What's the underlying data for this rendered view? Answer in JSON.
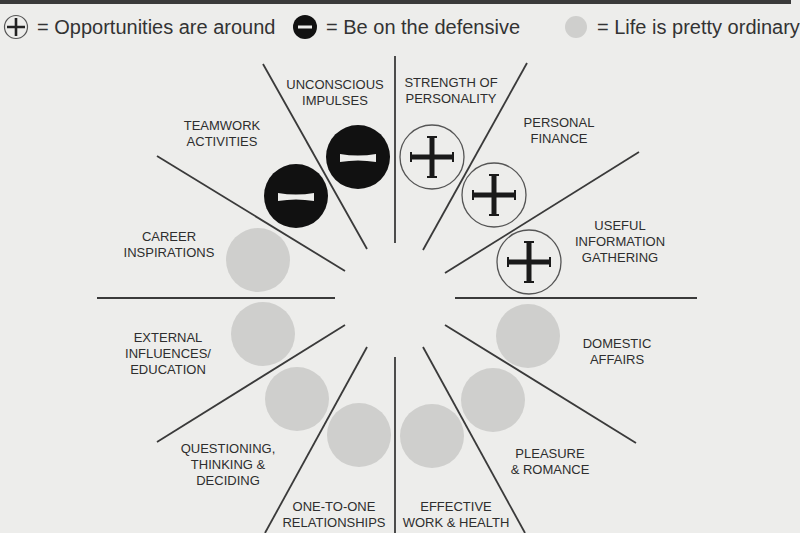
{
  "legend": {
    "items": [
      {
        "symbol": "plus-circle-icon",
        "label": "= Opportunities are around"
      },
      {
        "symbol": "minus-circle-icon",
        "label": "= Be on the defensive"
      },
      {
        "symbol": "grey-dot-icon",
        "label": "= Life is pretty ordinary"
      }
    ]
  },
  "colors": {
    "background": "#ededeb",
    "line": "#3a3a3a",
    "plus_ring": "#555555",
    "minus_fill": "#111111",
    "ordinary_fill": "#cfcfcd"
  },
  "segments": [
    {
      "line1": "STRENGTH OF",
      "line2": "PERSONALITY",
      "line3": "",
      "status": "opportunity"
    },
    {
      "line1": "PERSONAL",
      "line2": "FINANCE",
      "line3": "",
      "status": "opportunity"
    },
    {
      "line1": "USEFUL",
      "line2": "INFORMATION",
      "line3": "GATHERING",
      "status": "opportunity"
    },
    {
      "line1": "DOMESTIC",
      "line2": "AFFAIRS",
      "line3": "",
      "status": "ordinary"
    },
    {
      "line1": "PLEASURE",
      "line2": "& ROMANCE",
      "line3": "",
      "status": "ordinary"
    },
    {
      "line1": "EFFECTIVE",
      "line2": "WORK & HEALTH",
      "line3": "",
      "status": "ordinary"
    },
    {
      "line1": "ONE-TO-ONE",
      "line2": "RELATIONSHIPS",
      "line3": "",
      "status": "ordinary"
    },
    {
      "line1": "QUESTIONING,",
      "line2": "THINKING &",
      "line3": "DECIDING",
      "status": "ordinary"
    },
    {
      "line1": "EXTERNAL",
      "line2": "INFLUENCES/",
      "line3": "EDUCATION",
      "status": "ordinary"
    },
    {
      "line1": "CAREER",
      "line2": "INSPIRATIONS",
      "line3": "",
      "status": "ordinary"
    },
    {
      "line1": "TEAMWORK",
      "line2": "ACTIVITIES",
      "line3": "",
      "status": "defensive"
    },
    {
      "line1": "UNCONSCIOUS",
      "line2": "IMPULSES",
      "line3": "",
      "status": "defensive"
    }
  ]
}
